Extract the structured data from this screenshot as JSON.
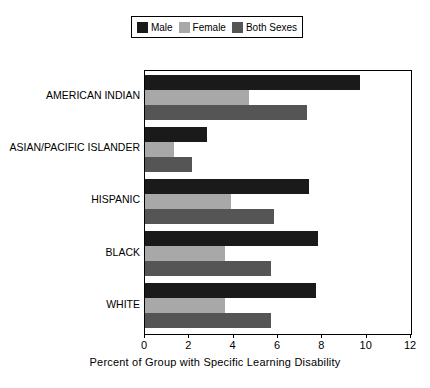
{
  "chart_data": {
    "type": "bar",
    "orientation": "horizontal",
    "title": "",
    "xlabel": "Percent of Group with Specific Learning Disability",
    "ylabel": "",
    "xlim": [
      0,
      12
    ],
    "xticks": [
      0,
      2,
      4,
      6,
      8,
      10,
      12
    ],
    "grid": false,
    "legend_position": "top",
    "categories": [
      "AMERICAN INDIAN",
      "ASIAN/PACIFIC ISLANDER",
      "HISPANIC",
      "BLACK",
      "WHITE"
    ],
    "series": [
      {
        "name": "Male",
        "color": "#1a1a1a",
        "values": [
          9.7,
          2.8,
          7.4,
          7.8,
          7.7
        ]
      },
      {
        "name": "Female",
        "color": "#a8a8a8",
        "values": [
          4.7,
          1.3,
          3.9,
          3.6,
          3.6
        ]
      },
      {
        "name": "Both Sexes",
        "color": "#555555",
        "values": [
          7.3,
          2.1,
          5.8,
          5.7,
          5.7
        ]
      }
    ]
  },
  "legend": {
    "entries": [
      {
        "label": "Male",
        "color": "#1a1a1a"
      },
      {
        "label": "Female",
        "color": "#a8a8a8"
      },
      {
        "label": "Both Sexes",
        "color": "#555555"
      }
    ]
  },
  "axis": {
    "x_title": "Percent of Group with Specific Learning Disability",
    "x_tick_labels": [
      "0",
      "2",
      "4",
      "6",
      "8",
      "10",
      "12"
    ]
  }
}
